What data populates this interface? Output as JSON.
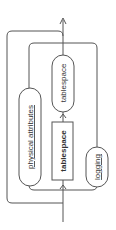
{
  "diagram": {
    "type": "railroad-syntax-diagram",
    "orientation": "rotated-90-ccw",
    "nodes": {
      "physical_attributes": {
        "label": "physical attributes",
        "kind": "nonterminal"
      },
      "tablespace_nonterminal": {
        "label": "tablespace",
        "kind": "nonterminal"
      },
      "tablespace_keyword": {
        "label": "tablespace",
        "kind": "keyword"
      },
      "logging": {
        "label": "logging",
        "kind": "nonterminal"
      }
    },
    "colors": {
      "line": "#555555",
      "text": "#333333",
      "background": "#ffffff"
    }
  }
}
